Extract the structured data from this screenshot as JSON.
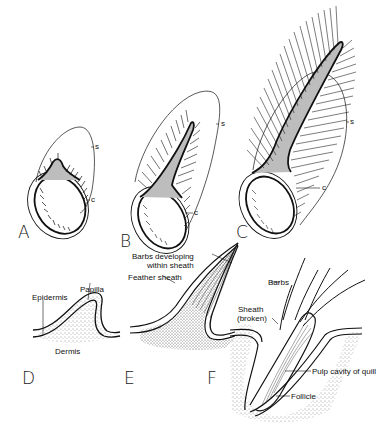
{
  "figure": {
    "panels": [
      {
        "id": "A",
        "letter": "A",
        "labels": {
          "sheath": "s",
          "collar": "c"
        }
      },
      {
        "id": "B",
        "letter": "B",
        "labels": {
          "sheath": "s",
          "collar": "c"
        }
      },
      {
        "id": "C",
        "letter": "C",
        "labels": {
          "sheath": "s",
          "collar": "c"
        }
      },
      {
        "id": "D",
        "letter": "D",
        "labels": {
          "epidermis": "Epidermis",
          "papilla": "Papilla",
          "dermis": "Dermis"
        }
      },
      {
        "id": "E",
        "letter": "E",
        "labels": {
          "barbs_developing_1": "Barbs developing",
          "barbs_developing_2": "within sheath",
          "feather_sheath": "Feather sheath"
        }
      },
      {
        "id": "F",
        "letter": "F",
        "labels": {
          "barbs": "Barbs",
          "sheath_1": "Sheath",
          "sheath_2": "(broken)",
          "pulp": "Pulp cavity of quill",
          "follicle": "Follicle"
        }
      }
    ]
  },
  "colors": {
    "ink": "#111111",
    "fill_gray": "#bdbdbd",
    "stipple": "#555555",
    "background": "#ffffff"
  }
}
